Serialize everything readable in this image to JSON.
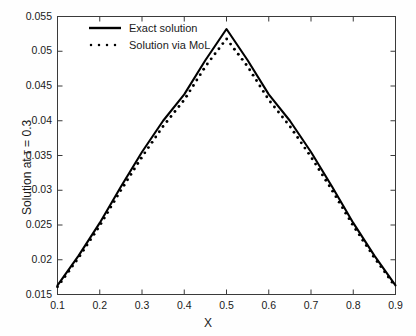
{
  "figure": {
    "background": "#ffffff",
    "axis_color": "#3a3a3a",
    "line_color": "#000000"
  },
  "axes": {
    "xlabel": "X",
    "ylabel": "Solution at τ = 0.3",
    "xticks": [
      "0.1",
      "0.2",
      "0.3",
      "0.4",
      "0.5",
      "0.6",
      "0.7",
      "0.8",
      "0.9"
    ],
    "yticks": [
      "0.015",
      "0.02",
      "0.025",
      "0.03",
      "0.035",
      "0.04",
      "0.045",
      "0.05",
      "0.055"
    ]
  },
  "legend": {
    "position": "top-left",
    "boxed": false,
    "entries": [
      {
        "label": "Exact solution",
        "style": "solid"
      },
      {
        "label": "Solution via MoL",
        "style": "dotted"
      }
    ]
  },
  "chart_data": {
    "type": "line",
    "title": "",
    "xlabel": "X",
    "ylabel": "Solution at τ = 0.3",
    "xlim": [
      0.1,
      0.9
    ],
    "ylim": [
      0.015,
      0.055
    ],
    "xticks": [
      0.1,
      0.2,
      0.3,
      0.4,
      0.5,
      0.6,
      0.7,
      0.8,
      0.9
    ],
    "yticks": [
      0.015,
      0.02,
      0.025,
      0.03,
      0.035,
      0.04,
      0.045,
      0.05,
      0.055
    ],
    "grid": false,
    "legend_position": "upper left",
    "x": [
      0.1,
      0.15,
      0.2,
      0.25,
      0.3,
      0.35,
      0.4,
      0.45,
      0.5,
      0.55,
      0.6,
      0.65,
      0.7,
      0.75,
      0.8,
      0.85,
      0.9
    ],
    "series": [
      {
        "name": "Exact solution",
        "style": "solid",
        "color": "#000000",
        "values": [
          0.0163,
          0.0206,
          0.0253,
          0.0305,
          0.0355,
          0.04,
          0.0438,
          0.0487,
          0.0532,
          0.0487,
          0.0438,
          0.04,
          0.0355,
          0.0305,
          0.0253,
          0.0206,
          0.0163
        ]
      },
      {
        "name": "Solution via MoL",
        "style": "dotted",
        "color": "#000000",
        "values": [
          0.0161,
          0.0203,
          0.0249,
          0.03,
          0.0348,
          0.0392,
          0.043,
          0.0478,
          0.0518,
          0.0478,
          0.043,
          0.0392,
          0.0348,
          0.03,
          0.0249,
          0.0203,
          0.0161
        ]
      }
    ]
  }
}
